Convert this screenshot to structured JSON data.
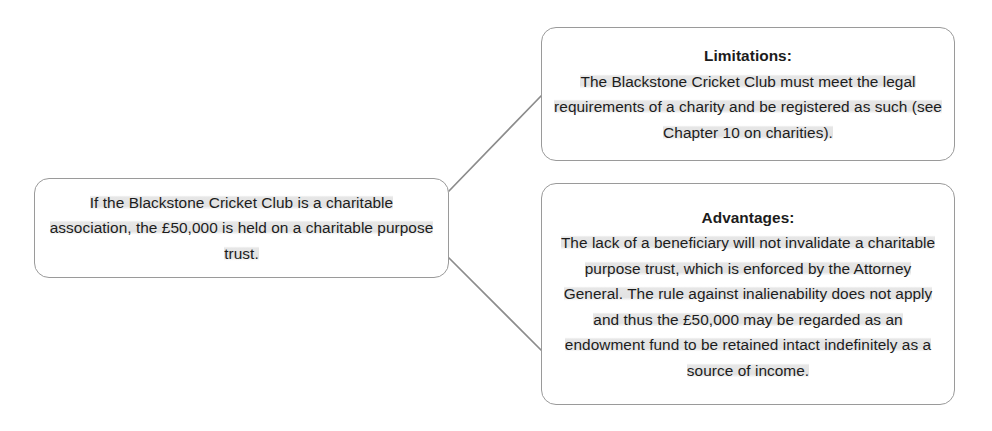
{
  "diagram": {
    "background_color": "#ffffff",
    "border_color": "#9a9a9a",
    "text_color": "#1c1c1c",
    "highlight_color": "#d9d9d9",
    "nodes": {
      "source": {
        "name": "source-node",
        "text": "If the Blackstone Cricket Club is a charitable association, the £50,000 is held on a charitable purpose trust."
      },
      "limitations": {
        "name": "limitations-node",
        "heading": "Limitations:",
        "text": "The Blackstone Cricket Club must meet the legal requirements of a charity and be registered as such (see Chapter 10 on charities)."
      },
      "advantages": {
        "name": "advantages-node",
        "heading": "Advantages:",
        "text": "The lack of a beneficiary will not invalidate a charitable purpose trust, which is enforced by the Attorney General. The rule against inalienability does not apply and thus the £50,000 may be regarded as an endowment fund to be retained intact indefinitely as a source of income."
      }
    },
    "connectors": [
      {
        "name": "connector-source-to-limitations",
        "from": "source",
        "to": "limitations"
      },
      {
        "name": "connector-source-to-advantages",
        "from": "source",
        "to": "advantages"
      }
    ]
  }
}
